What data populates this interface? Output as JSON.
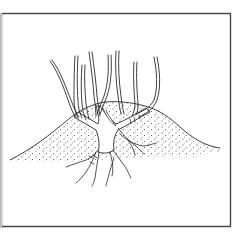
{
  "figure": {
    "colors": {
      "ink": "#2a2a2a",
      "border": "#4a4a4a",
      "background": "#ffffff",
      "stipple": "#3a3a3a"
    },
    "elements": {
      "shoot_count": 8,
      "has_mound": true,
      "has_roots": true,
      "has_frame": true
    }
  }
}
